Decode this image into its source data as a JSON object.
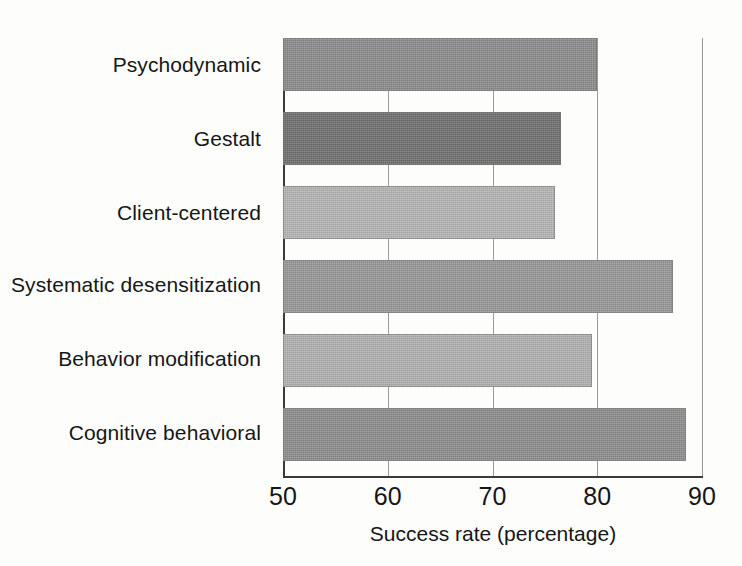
{
  "chart_data": {
    "type": "bar",
    "orientation": "horizontal",
    "title": "",
    "xlabel": "Success rate (percentage)",
    "ylabel": "",
    "xlim": [
      50,
      90
    ],
    "xticks": [
      50,
      60,
      70,
      80,
      90
    ],
    "xtick_labels": [
      "50",
      "60",
      "70",
      "80",
      "90"
    ],
    "grid": true,
    "grid_axis": "x",
    "legend": false,
    "legend_position": "none",
    "categories": [
      "Psychodynamic",
      "Gestalt",
      "Client-centered",
      "Systematic desensitization",
      "Behavior modification",
      "Cognitive behavioral"
    ],
    "values": [
      80.0,
      76.5,
      76.0,
      87.2,
      79.5,
      88.5
    ],
    "bar_colors": [
      "#8a8a8a",
      "#6e6e6e",
      "#b4b4b4",
      "#969696",
      "#b0b0b0",
      "#8c8c8c"
    ],
    "series": [
      {
        "name": "Success rate",
        "values": [
          80.0,
          76.5,
          76.0,
          87.2,
          79.5,
          88.5
        ]
      }
    ],
    "bars": [
      {
        "category": "Psychodynamic",
        "value": 80.0,
        "color": "#8a8a8a"
      },
      {
        "category": "Gestalt",
        "value": 76.5,
        "color": "#6e6e6e"
      },
      {
        "category": "Client-centered",
        "value": 76.0,
        "color": "#b4b4b4"
      },
      {
        "category": "Systematic desensitization",
        "value": 87.2,
        "color": "#969696"
      },
      {
        "category": "Behavior modification",
        "value": 79.5,
        "color": "#b0b0b0"
      },
      {
        "category": "Cognitive behavioral",
        "value": 88.5,
        "color": "#8c8c8c"
      }
    ]
  },
  "style": {
    "background": "#fdfdfc",
    "axis_color": "#3a3a3a",
    "grid_color": "#9a9a9a",
    "text_color": "#161616"
  }
}
